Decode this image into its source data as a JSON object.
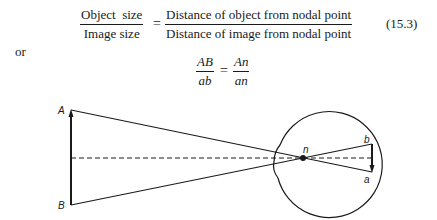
{
  "equation_1": {
    "lhs_numerator": "Object  size",
    "lhs_denominator": "Image size",
    "equals": "=",
    "rhs_numerator": "Distance of object from nodal point",
    "rhs_denominator": "Distance of image from nodal point",
    "number": "(15.3)"
  },
  "connector": "or",
  "equation_2": {
    "lhs_numerator": "AB",
    "lhs_denominator": "ab",
    "equals": "=",
    "rhs_numerator": "An",
    "rhs_denominator": "an"
  },
  "diagram": {
    "labels": {
      "object_top": "A",
      "object_bottom": "B",
      "nodal_point": "n",
      "image_top": "b",
      "image_bottom": "a"
    }
  }
}
